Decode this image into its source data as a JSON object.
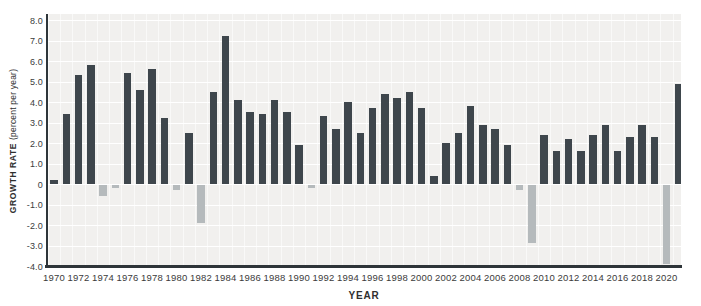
{
  "figure": {
    "y_axis": {
      "title_bold": "GROWTH RATE",
      "title_note": "(percent per year)",
      "tick_labels": [
        "8.0",
        "7.0",
        "6.0",
        "5.0",
        "4.0",
        "3.0",
        "2.0",
        "1.0",
        "0",
        "-1.0",
        "-2.0",
        "-3.0",
        "-4.0"
      ],
      "tick_values": [
        8,
        7,
        6,
        5,
        4,
        3,
        2,
        1,
        0,
        -1,
        -2,
        -3,
        -4
      ]
    },
    "x_axis": {
      "title": "YEAR",
      "tick_labels": [
        "1970",
        "1972",
        "1974",
        "1976",
        "1978",
        "1980",
        "1982",
        "1984",
        "1986",
        "1988",
        "1990",
        "1992",
        "1994",
        "1996",
        "1998",
        "2000",
        "2002",
        "2004",
        "2006",
        "2008",
        "2010",
        "2012",
        "2014",
        "2016",
        "2018",
        "2020"
      ]
    }
  },
  "chart_data": {
    "type": "bar",
    "title": "",
    "xlabel": "YEAR",
    "ylabel": "GROWTH RATE (percent per year)",
    "ylim": [
      -4.0,
      8.0
    ],
    "grid": "on",
    "x_tick_interval": 2,
    "years": [
      1970,
      1971,
      1972,
      1973,
      1974,
      1975,
      1976,
      1977,
      1978,
      1979,
      1980,
      1981,
      1982,
      1983,
      1984,
      1985,
      1986,
      1987,
      1988,
      1989,
      1990,
      1991,
      1992,
      1993,
      1994,
      1995,
      1996,
      1997,
      1998,
      1999,
      2000,
      2001,
      2002,
      2003,
      2004,
      2005,
      2006,
      2007,
      2008,
      2009,
      2010,
      2011,
      2012,
      2013,
      2014,
      2015,
      2016,
      2017,
      2018,
      2019,
      2020,
      2021
    ],
    "values": [
      0.2,
      3.4,
      5.3,
      5.8,
      -0.6,
      -0.2,
      5.4,
      4.6,
      5.6,
      3.2,
      -0.3,
      2.5,
      -1.9,
      4.5,
      7.2,
      4.1,
      3.5,
      3.4,
      4.1,
      3.5,
      1.9,
      -0.2,
      3.3,
      2.7,
      4.0,
      2.5,
      3.7,
      4.4,
      4.2,
      4.5,
      3.7,
      0.4,
      2.0,
      2.5,
      3.8,
      2.9,
      2.7,
      1.9,
      -0.3,
      -2.9,
      2.4,
      1.6,
      2.2,
      1.6,
      2.4,
      2.9,
      1.6,
      2.3,
      2.9,
      2.3,
      -3.9,
      4.9
    ],
    "positive_bar_color": "#3e464c",
    "negative_bar_color": "#b5babc",
    "plot_background": "#f1f0ee",
    "gridline_color": "#ffffff"
  },
  "colors": {
    "axis_line": "#2e3539",
    "tick_text": "#3b3b3b",
    "page_background": "#ffffff"
  }
}
